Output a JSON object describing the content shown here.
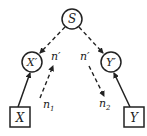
{
  "diagram": {
    "type": "graphical-model",
    "nodes": {
      "S": {
        "label": "S",
        "shape": "circle"
      },
      "Xp": {
        "label": "X′",
        "shape": "circle"
      },
      "Yp": {
        "label": "Y′",
        "shape": "circle"
      },
      "X": {
        "label": "X",
        "shape": "square"
      },
      "Y": {
        "label": "Y",
        "shape": "square"
      }
    },
    "edge_labels": {
      "left_n_prime": "n′",
      "right_n_prime": "n′",
      "n1": "n",
      "n1_sub": "1",
      "n2": "n",
      "n2_sub": "2"
    },
    "edges": [
      {
        "from": "S",
        "to": "X′",
        "style": "dashed",
        "arrow": true
      },
      {
        "from": "S",
        "to": "Y′",
        "style": "dashed",
        "arrow": true
      },
      {
        "from": "X",
        "to": "X′",
        "style": "solid",
        "arrow": true
      },
      {
        "from": "Y",
        "to": "Y′",
        "style": "solid",
        "arrow": true
      },
      {
        "from": "n1",
        "to": "n′ (left)",
        "style": "dashed",
        "arrow": true
      },
      {
        "from": "n′ (right)",
        "to": "n2",
        "style": "dashed",
        "arrow": true
      }
    ],
    "colors": {
      "stroke": "#222222",
      "background": "#ffffff"
    }
  }
}
